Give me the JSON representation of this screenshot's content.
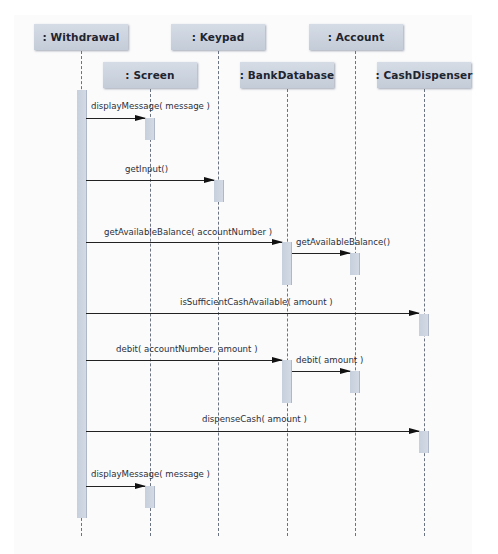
{
  "diagram": {
    "type": "uml-sequence",
    "objects": [
      {
        "id": "withdrawal",
        "label": ": Withdrawal"
      },
      {
        "id": "screen",
        "label": ": Screen"
      },
      {
        "id": "keypad",
        "label": ": Keypad"
      },
      {
        "id": "bankdatabase",
        "label": ": BankDatabase"
      },
      {
        "id": "account",
        "label": ": Account"
      },
      {
        "id": "cashdispenser",
        "label": ": CashDispenser"
      }
    ],
    "messages": [
      {
        "from": "withdrawal",
        "to": "screen",
        "label": "displayMessage( message )"
      },
      {
        "from": "withdrawal",
        "to": "keypad",
        "label": "getInput()"
      },
      {
        "from": "withdrawal",
        "to": "bankdatabase",
        "label": "getAvailableBalance( accountNumber )"
      },
      {
        "from": "bankdatabase",
        "to": "account",
        "label": "getAvailableBalance()"
      },
      {
        "from": "withdrawal",
        "to": "cashdispenser",
        "label": "isSufficientCashAvailable( amount )"
      },
      {
        "from": "withdrawal",
        "to": "bankdatabase",
        "label": "debit( accountNumber, amount )"
      },
      {
        "from": "bankdatabase",
        "to": "account",
        "label": "debit( amount )"
      },
      {
        "from": "withdrawal",
        "to": "cashdispenser",
        "label": "dispenseCash( amount )"
      },
      {
        "from": "withdrawal",
        "to": "screen",
        "label": "displayMessage( message )"
      }
    ]
  }
}
